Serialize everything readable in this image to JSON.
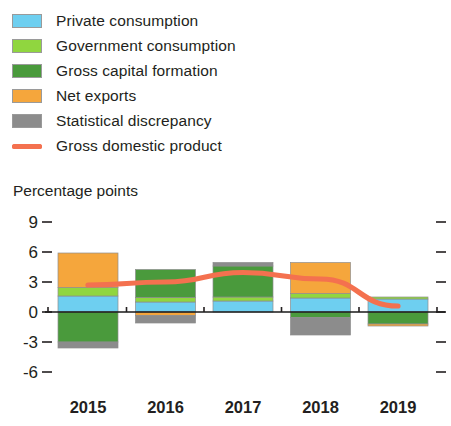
{
  "legend": {
    "items": [
      {
        "label": "Private consumption",
        "icon": "color-swatch",
        "color": "#6ecff0",
        "type": "swatch"
      },
      {
        "label": "Government consumption",
        "icon": "color-swatch",
        "color": "#90d63f",
        "type": "swatch"
      },
      {
        "label": "Gross capital formation",
        "icon": "color-swatch",
        "color": "#4a9a3c",
        "type": "swatch"
      },
      {
        "label": "Net exports",
        "icon": "color-swatch",
        "color": "#f5a63c",
        "type": "swatch"
      },
      {
        "label": "Statistical discrepancy",
        "icon": "color-swatch",
        "color": "#8c8c8c",
        "type": "swatch"
      },
      {
        "label": "Gross domestic product",
        "icon": "line-swatch",
        "color": "#f4714f",
        "type": "line"
      }
    ]
  },
  "axis_title": "Percentage points",
  "chart_data": {
    "type": "bar",
    "title": "",
    "subtitle": "",
    "xlabel": "",
    "ylabel": "Percentage points",
    "categories": [
      "2015",
      "2016",
      "2017",
      "2018",
      "2019"
    ],
    "ylim": [
      -6,
      9
    ],
    "yticks": [
      9,
      6,
      3,
      0,
      -3,
      -6
    ],
    "ytick_labels": [
      "9",
      "6",
      "3",
      "0",
      "-3",
      "-6"
    ],
    "grid": false,
    "legend_position": "top-left",
    "stacked": true,
    "series": [
      {
        "name": "Private consumption",
        "color": "#6ecff0",
        "values": [
          1.6,
          1.0,
          1.1,
          1.4,
          1.3
        ]
      },
      {
        "name": "Government consumption",
        "color": "#90d63f",
        "values": [
          0.85,
          0.45,
          0.4,
          0.45,
          0.2
        ]
      },
      {
        "name": "Gross capital formation",
        "color": "#4a9a3c",
        "values": [
          -3.0,
          2.8,
          3.1,
          -0.55,
          -1.2
        ]
      },
      {
        "name": "Net exports",
        "color": "#f5a63c",
        "values": [
          3.45,
          -0.35,
          0.0,
          3.1,
          -0.2
        ]
      },
      {
        "name": "Statistical discrepancy",
        "color": "#8c8c8c",
        "values": [
          -0.6,
          -0.75,
          0.35,
          -1.75,
          0.0
        ]
      }
    ],
    "line_series": {
      "name": "Gross domestic product",
      "color": "#f4714f",
      "values": [
        2.7,
        3.0,
        3.95,
        3.3,
        0.6
      ]
    }
  }
}
